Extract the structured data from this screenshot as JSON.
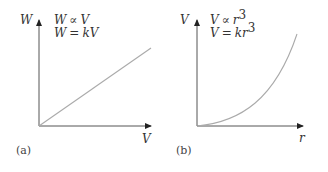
{
  "panels": [
    {
      "caption": "(a)",
      "y_axis_label": "W",
      "x_axis_label": "V",
      "equation_1": {
        "lhs": "W",
        "op": "∝",
        "rhs": "V"
      },
      "equation_2": {
        "lhs": "W",
        "op": "=",
        "rhs_coef": "k",
        "rhs_var": "V"
      },
      "relation": "linear"
    },
    {
      "caption": "(b)",
      "y_axis_label": "V",
      "x_axis_label": "r",
      "equation_1": {
        "lhs": "V",
        "op": "∝",
        "rhs": "r",
        "exp": "3"
      },
      "equation_2": {
        "lhs": "V",
        "op": "=",
        "rhs_coef": "k",
        "rhs_var": "r",
        "exp": "3"
      },
      "relation": "cubic"
    }
  ],
  "colors": {
    "axis": "#333333",
    "curve": "#999999",
    "text": "#333333"
  }
}
